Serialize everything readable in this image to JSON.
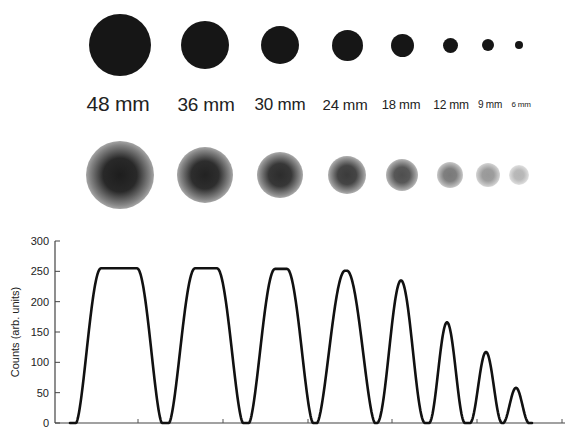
{
  "figure": {
    "sizes": [
      {
        "label": "48 mm",
        "cx": 120,
        "r": 31,
        "label_cx": 118,
        "font": 21,
        "blur_r": 34,
        "blur_core": 0.92
      },
      {
        "label": "36 mm",
        "cx": 205,
        "r": 24,
        "label_cx": 206,
        "font": 19,
        "blur_r": 28,
        "blur_core": 0.9
      },
      {
        "label": "30 mm",
        "cx": 280,
        "r": 19,
        "label_cx": 280,
        "font": 17,
        "blur_r": 23,
        "blur_core": 0.86
      },
      {
        "label": "24 mm",
        "cx": 347,
        "r": 15.5,
        "label_cx": 345,
        "font": 15,
        "blur_r": 19,
        "blur_core": 0.8
      },
      {
        "label": "18 mm",
        "cx": 402,
        "r": 11.5,
        "label_cx": 401,
        "font": 13,
        "blur_r": 16,
        "blur_core": 0.72
      },
      {
        "label": "12 mm",
        "cx": 450,
        "r": 7.5,
        "label_cx": 451,
        "font": 12,
        "blur_r": 13,
        "blur_core": 0.55
      },
      {
        "label": "9 mm",
        "cx": 488,
        "r": 6,
        "label_cx": 490,
        "font": 10,
        "blur_r": 12,
        "blur_core": 0.42
      },
      {
        "label": "6 mm",
        "cx": 519,
        "r": 4,
        "label_cx": 521,
        "font": 8,
        "blur_r": 10,
        "blur_core": 0.3
      }
    ],
    "rows": {
      "sharp_cy": 45,
      "label_y": 105,
      "blur_cy": 175
    }
  },
  "chart_data": {
    "type": "line",
    "title": "",
    "xlabel": "",
    "ylabel": "Counts (arb. units)",
    "ylim": [
      0,
      300
    ],
    "yticks": [
      0,
      50,
      100,
      150,
      200,
      250,
      300
    ],
    "grid": false,
    "legend": null,
    "series": [
      {
        "name": "profile",
        "peaks": [
          {
            "label": "48 mm",
            "peak_value": 255,
            "center_px": 119,
            "half_width_px": 43,
            "flat_top_px": 36
          },
          {
            "label": "36 mm",
            "peak_value": 255,
            "center_px": 206,
            "half_width_px": 37,
            "flat_top_px": 22
          },
          {
            "label": "30 mm",
            "peak_value": 254,
            "center_px": 281,
            "half_width_px": 32,
            "flat_top_px": 12
          },
          {
            "label": "24 mm",
            "peak_value": 251,
            "center_px": 346,
            "half_width_px": 29,
            "flat_top_px": 2
          },
          {
            "label": "18 mm",
            "peak_value": 235,
            "center_px": 401,
            "half_width_px": 24,
            "flat_top_px": 0
          },
          {
            "label": "12 mm",
            "peak_value": 166,
            "center_px": 447,
            "half_width_px": 18,
            "flat_top_px": 0
          },
          {
            "label": "9 mm",
            "peak_value": 117,
            "center_px": 486,
            "half_width_px": 16,
            "flat_top_px": 0
          },
          {
            "label": "6 mm",
            "peak_value": 58,
            "center_px": 516,
            "half_width_px": 13,
            "flat_top_px": 0
          }
        ]
      }
    ],
    "axes_px": {
      "x0": 55,
      "x1": 565,
      "y0": 423,
      "y300": 241
    },
    "xticks_px": [
      138,
      223,
      308,
      392,
      477,
      562
    ]
  }
}
